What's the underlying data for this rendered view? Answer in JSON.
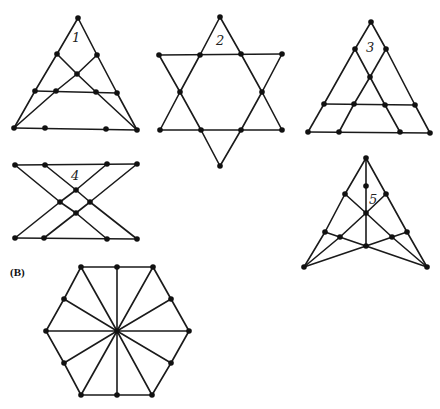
{
  "panel_label": "(B)",
  "figures": [
    {
      "id": "1",
      "label": "1",
      "label_pos": [
        72,
        42
      ],
      "nodes": [
        [
          78,
          18
        ],
        [
          57,
          54
        ],
        [
          97,
          55
        ],
        [
          77,
          74
        ],
        [
          35,
          91
        ],
        [
          56,
          91
        ],
        [
          96,
          92
        ],
        [
          117,
          93
        ],
        [
          14,
          128
        ],
        [
          45,
          128
        ],
        [
          106,
          129
        ],
        [
          137,
          130
        ]
      ],
      "edges": [
        [
          0,
          1
        ],
        [
          1,
          4
        ],
        [
          4,
          8
        ],
        [
          0,
          2
        ],
        [
          2,
          7
        ],
        [
          7,
          11
        ],
        [
          8,
          11
        ],
        [
          4,
          7
        ],
        [
          1,
          3
        ],
        [
          3,
          6
        ],
        [
          6,
          11
        ],
        [
          2,
          3
        ],
        [
          3,
          5
        ],
        [
          5,
          8
        ]
      ]
    },
    {
      "id": "2",
      "label": "2",
      "label_pos": [
        216,
        45
      ],
      "nodes": [
        [
          220,
          17
        ],
        [
          159,
          55
        ],
        [
          200,
          55
        ],
        [
          241,
          54
        ],
        [
          282,
          54
        ],
        [
          180,
          92
        ],
        [
          262,
          92
        ],
        [
          160,
          130
        ],
        [
          201,
          130
        ],
        [
          241,
          130
        ],
        [
          282,
          130
        ],
        [
          220,
          166
        ]
      ],
      "edges": [
        [
          0,
          2
        ],
        [
          2,
          5
        ],
        [
          5,
          7
        ],
        [
          7,
          10
        ],
        [
          10,
          6
        ],
        [
          6,
          3
        ],
        [
          3,
          0
        ],
        [
          1,
          4
        ],
        [
          1,
          5
        ],
        [
          5,
          8
        ],
        [
          8,
          11
        ],
        [
          11,
          9
        ],
        [
          9,
          6
        ],
        [
          6,
          4
        ]
      ]
    },
    {
      "id": "3",
      "label": "3",
      "label_pos": [
        366,
        52
      ],
      "nodes": [
        [
          371,
          22
        ],
        [
          355,
          49
        ],
        [
          386,
          49
        ],
        [
          370,
          77
        ],
        [
          324,
          104
        ],
        [
          354,
          104
        ],
        [
          385,
          105
        ],
        [
          415,
          105
        ],
        [
          308,
          132
        ],
        [
          339,
          132
        ],
        [
          400,
          132
        ],
        [
          430,
          133
        ]
      ],
      "edges": [
        [
          0,
          1
        ],
        [
          1,
          4
        ],
        [
          4,
          8
        ],
        [
          0,
          2
        ],
        [
          2,
          7
        ],
        [
          7,
          11
        ],
        [
          8,
          11
        ],
        [
          4,
          7
        ],
        [
          1,
          3
        ],
        [
          3,
          6
        ],
        [
          6,
          10
        ],
        [
          2,
          3
        ],
        [
          3,
          5
        ],
        [
          5,
          9
        ]
      ]
    },
    {
      "id": "4",
      "label": "4",
      "label_pos": [
        71,
        180
      ],
      "nodes": [
        [
          15,
          165
        ],
        [
          45,
          165
        ],
        [
          107,
          164
        ],
        [
          137,
          164
        ],
        [
          76,
          190
        ],
        [
          60,
          202
        ],
        [
          90,
          202
        ],
        [
          76,
          213
        ],
        [
          15,
          238
        ],
        [
          44,
          238
        ],
        [
          107,
          239
        ],
        [
          137,
          239
        ]
      ],
      "edges": [
        [
          0,
          3
        ],
        [
          8,
          11
        ],
        [
          0,
          5
        ],
        [
          5,
          7
        ],
        [
          7,
          10
        ],
        [
          1,
          4
        ],
        [
          4,
          6
        ],
        [
          6,
          11
        ],
        [
          2,
          4
        ],
        [
          4,
          5
        ],
        [
          5,
          8
        ],
        [
          3,
          6
        ],
        [
          6,
          7
        ],
        [
          7,
          9
        ]
      ]
    },
    {
      "id": "5",
      "label": "5",
      "label_pos": [
        369,
        204
      ],
      "nodes": [
        [
          366,
          158
        ],
        [
          366,
          186
        ],
        [
          345,
          194
        ],
        [
          386,
          194
        ],
        [
          366,
          213
        ],
        [
          325,
          232
        ],
        [
          340,
          237
        ],
        [
          392,
          237
        ],
        [
          407,
          232
        ],
        [
          366,
          246
        ],
        [
          304,
          267
        ],
        [
          427,
          267
        ]
      ],
      "edges": [
        [
          0,
          1
        ],
        [
          1,
          4
        ],
        [
          4,
          9
        ],
        [
          0,
          2
        ],
        [
          2,
          5
        ],
        [
          5,
          10
        ],
        [
          0,
          3
        ],
        [
          3,
          8
        ],
        [
          8,
          11
        ],
        [
          2,
          4
        ],
        [
          3,
          4
        ],
        [
          4,
          6
        ],
        [
          6,
          10
        ],
        [
          4,
          7
        ],
        [
          7,
          11
        ],
        [
          5,
          9
        ],
        [
          8,
          9
        ],
        [
          9,
          10
        ],
        [
          9,
          11
        ]
      ]
    },
    {
      "id": "B",
      "label": "",
      "label_pos": [
        0,
        0
      ],
      "nodes": [
        [
          81,
          267
        ],
        [
          117,
          267
        ],
        [
          153,
          267
        ],
        [
          171,
          299
        ],
        [
          189,
          331
        ],
        [
          171,
          363
        ],
        [
          152,
          395
        ],
        [
          117,
          395
        ],
        [
          81,
          395
        ],
        [
          64,
          363
        ],
        [
          46,
          331
        ],
        [
          64,
          299
        ],
        [
          117,
          331
        ]
      ],
      "edges": [
        [
          0,
          1
        ],
        [
          1,
          2
        ],
        [
          2,
          3
        ],
        [
          3,
          4
        ],
        [
          4,
          5
        ],
        [
          5,
          6
        ],
        [
          6,
          7
        ],
        [
          7,
          8
        ],
        [
          8,
          9
        ],
        [
          9,
          10
        ],
        [
          10,
          11
        ],
        [
          11,
          0
        ],
        [
          12,
          0
        ],
        [
          12,
          1
        ],
        [
          12,
          2
        ],
        [
          12,
          3
        ],
        [
          12,
          4
        ],
        [
          12,
          5
        ],
        [
          12,
          6
        ],
        [
          12,
          7
        ],
        [
          12,
          8
        ],
        [
          12,
          9
        ],
        [
          12,
          10
        ],
        [
          12,
          11
        ]
      ]
    }
  ],
  "style": {
    "line_color": "#1a1a1a",
    "node_color": "#111111",
    "background": "#ffffff",
    "node_radius": 2.8
  }
}
